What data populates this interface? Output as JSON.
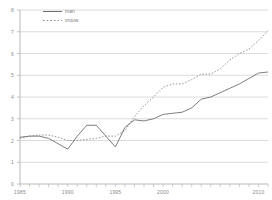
{
  "chart_data": {
    "type": "line",
    "title": "",
    "xlabel": "",
    "ylabel": "",
    "xlim": [
      1985,
      2011
    ],
    "ylim": [
      0,
      8
    ],
    "grid": true,
    "legend_position": "top-left",
    "y_ticks": [
      "0",
      "1",
      "2",
      "3",
      "4",
      "5",
      "6",
      "7",
      "8"
    ],
    "y_tick_values": [
      0,
      1,
      2,
      3,
      4,
      5,
      6,
      7,
      8
    ],
    "x_ticks": [
      "1985",
      "1990",
      "1995",
      "2000",
      "2010"
    ],
    "x_tick_values": [
      1985,
      1990,
      1995,
      2000,
      2010
    ],
    "x": [
      1985,
      1986,
      1987,
      1988,
      1989,
      1990,
      1991,
      1992,
      1993,
      1994,
      1995,
      1996,
      1997,
      1998,
      1999,
      2000,
      2001,
      2002,
      2003,
      2004,
      2005,
      2006,
      2007,
      2008,
      2009,
      2010,
      2011
    ],
    "series": [
      {
        "name": "man",
        "style": "solid",
        "color": "#6f6f6f",
        "values": [
          2.15,
          2.2,
          2.2,
          2.1,
          1.85,
          1.6,
          2.2,
          2.7,
          2.7,
          2.2,
          1.7,
          2.6,
          2.95,
          2.9,
          3.0,
          3.2,
          3.25,
          3.3,
          3.5,
          3.9,
          4.0,
          4.2,
          4.4,
          4.6,
          4.85,
          5.1,
          5.15
        ]
      },
      {
        "name": "vrouw",
        "style": "dotted",
        "color": "#9a9a9a",
        "values": [
          2.1,
          2.2,
          2.25,
          2.25,
          2.15,
          2.0,
          2.0,
          2.05,
          2.1,
          2.2,
          2.2,
          2.45,
          3.1,
          3.6,
          4.0,
          4.45,
          4.6,
          4.6,
          4.8,
          5.05,
          5.05,
          5.3,
          5.7,
          6.0,
          6.2,
          6.6,
          7.05
        ]
      }
    ]
  },
  "legend": {
    "items": [
      {
        "label": "man"
      },
      {
        "label": "vrouw"
      }
    ]
  },
  "colors": {
    "axis": "#b9b9b9",
    "grid": "#d3d3d3",
    "tick_text": "#8a8a8a",
    "series_man": "#6f6f6f",
    "series_vrouw": "#9a9a9a",
    "background": "#ffffff"
  }
}
